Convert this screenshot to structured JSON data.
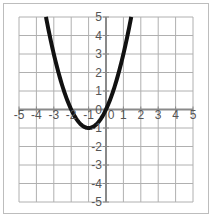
{
  "chart_data": {
    "type": "line",
    "title": "",
    "xlabel": "",
    "ylabel": "",
    "xlim": [
      -5,
      5
    ],
    "ylim": [
      -5,
      5
    ],
    "grid": true,
    "x_ticks": [
      "-5",
      "-4",
      "-3",
      "-2",
      "-1",
      "0",
      "1",
      "2",
      "3",
      "4",
      "5"
    ],
    "y_ticks": [
      "5",
      "4",
      "3",
      "2",
      "1",
      "0",
      "-1",
      "-2",
      "-3",
      "-4",
      "-5"
    ],
    "series": [
      {
        "name": "parabola",
        "equation_estimate": "y = x^2 + 2x",
        "x": [
          -3.45,
          -3,
          -2.5,
          -2,
          -1.5,
          -1,
          -0.5,
          0,
          0.5,
          1,
          1.45
        ],
        "y": [
          5,
          3,
          1.25,
          0,
          -0.75,
          -1,
          -0.75,
          0,
          1.25,
          3,
          5
        ],
        "color": "#111111"
      }
    ],
    "legend": null
  },
  "colors": {
    "grid": "#b0b0b0",
    "axis": "#8a8a8a",
    "curve": "#111111",
    "frame": "#bdbdbd"
  }
}
